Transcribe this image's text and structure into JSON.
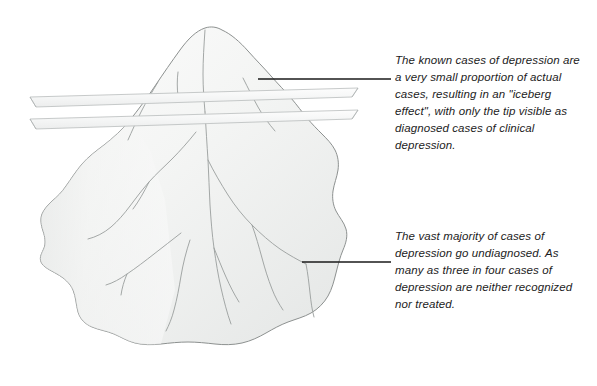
{
  "figure": {
    "background_color": "#ffffff",
    "iceberg": {
      "fill_light": "#fbfbfb",
      "fill_mid": "#f0f1f0",
      "fill_shadow": "#e4e6e4",
      "outline_color": "#8d9190",
      "crevasse_color": "#9a9e9d",
      "tip_label": "iceberg-tip-above-water",
      "mass_label": "iceberg-mass-below-water"
    },
    "waterline": {
      "band_count": 2,
      "fill": "#f4f5f5",
      "edge_color": "#b9bcbc",
      "label": "waterline-bands"
    },
    "leaders": {
      "color": "#1a1a1a",
      "top_label": "leader-line-top",
      "bottom_label": "leader-line-bottom"
    }
  },
  "callouts": {
    "top": {
      "id": "callout-top",
      "text": "The known cases of depression are a very small proportion of actual cases, resulting in an \"iceberg effect\", with only the tip visible as diagnosed cases of clinical depression.",
      "lines": [
        "The known cases of",
        "depression are a very",
        "small proportion of actual",
        "cases, resulting in an",
        "\"iceberg effect\", with",
        "only the tip visible as",
        "diagnosed cases of",
        "clinical depression."
      ]
    },
    "bottom": {
      "id": "callout-bottom",
      "text": "The vast majority of cases of depression go undiagnosed. As many as three in four cases of depression are neither recognized nor treated.",
      "lines": [
        "The vast majority of",
        "cases of depression go",
        "undiagnosed. As many",
        "as three in four cases of",
        "depression are neither",
        "recognized nor treated."
      ]
    }
  }
}
